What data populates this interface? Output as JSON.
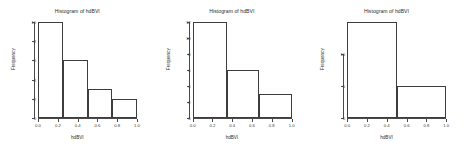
{
  "figure": {
    "background": "#ffffff",
    "axis_color": "#4a4a4a",
    "bar_border_color": "#3d3d3d",
    "panel_count": 3
  },
  "chart_data": [
    {
      "type": "bar",
      "title": "Histogram of hdBVI",
      "xlabel": "hdBVI",
      "ylabel": "Frequency",
      "bin_edges": [
        0.0,
        0.25,
        0.5,
        0.75,
        1.0
      ],
      "categories": [
        "0.0-0.25",
        "0.25-0.5",
        "0.5-0.75",
        "0.75-1.0"
      ],
      "values": [
        10,
        6,
        3,
        2
      ],
      "xlim": [
        0.0,
        1.0
      ],
      "ylim": [
        0,
        10
      ],
      "xticks": [
        0.0,
        0.2,
        0.4,
        0.6,
        0.8,
        1.0
      ],
      "xticklabels": [
        "0.0",
        "0.2",
        "0.4",
        "0.6",
        "0.8",
        "1.0"
      ],
      "yticks": [
        0,
        2,
        4,
        6,
        8,
        10
      ],
      "yticklabels": [
        "0",
        "2",
        "4",
        "6",
        "8",
        "10"
      ],
      "grid": false,
      "legend": false
    },
    {
      "type": "bar",
      "title": "Histogram of hdBVI",
      "xlabel": "hdBVI",
      "ylabel": "Frequency",
      "bin_edges": [
        0.0,
        0.35,
        0.67,
        1.0
      ],
      "categories": [
        "0.0-0.35",
        "0.35-0.67",
        "0.67-1.0"
      ],
      "values": [
        12,
        6,
        3
      ],
      "xlim": [
        0.0,
        1.0
      ],
      "ylim": [
        0,
        12
      ],
      "xticks": [
        0.0,
        0.2,
        0.4,
        0.6,
        0.8,
        1.0
      ],
      "xticklabels": [
        "0.0",
        "0.2",
        "0.4",
        "0.6",
        "0.8",
        "1.0"
      ],
      "yticks": [
        0,
        2,
        4,
        6,
        8,
        10,
        12
      ],
      "yticklabels": [
        "0",
        "2",
        "4",
        "6",
        "8",
        "10",
        "12"
      ],
      "grid": false,
      "legend": false
    },
    {
      "type": "bar",
      "title": "Histogram of hdBVI",
      "xlabel": "hdBVI",
      "ylabel": "Frequency",
      "bin_edges": [
        0.0,
        0.5,
        1.0
      ],
      "categories": [
        "0.0-0.5",
        "0.5-1.0"
      ],
      "values": [
        15,
        5
      ],
      "xlim": [
        0.0,
        1.0
      ],
      "ylim": [
        0,
        15
      ],
      "xticks": [
        0.0,
        0.2,
        0.4,
        0.6,
        0.8,
        1.0
      ],
      "xticklabels": [
        "0.0",
        "0.2",
        "0.4",
        "0.6",
        "0.8",
        "1.0"
      ],
      "yticks": [
        0,
        5,
        10
      ],
      "yticklabels": [
        "0",
        "5",
        "10"
      ],
      "grid": false,
      "legend": false
    }
  ]
}
